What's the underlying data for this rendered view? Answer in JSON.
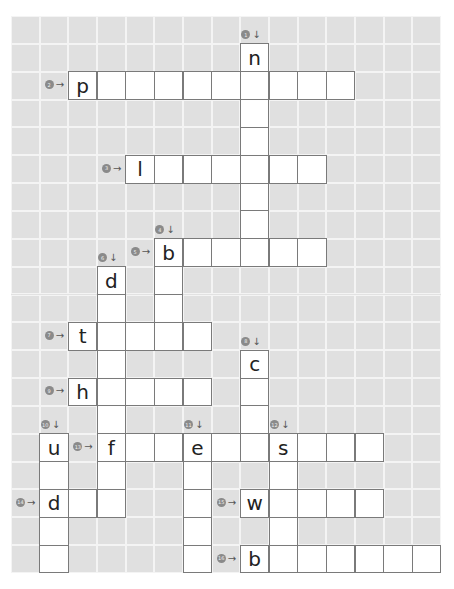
{
  "puzzle": {
    "type": "crossword",
    "grid": {
      "cols": 15,
      "rows": 20
    },
    "colors": {
      "background": "#ffffff",
      "grid_cell": "#e0e0e0",
      "grid_line": "#f4f4f4",
      "answer_cell": "#ffffff",
      "answer_border": "#7a7a7a",
      "marker": "#8a8a8a"
    },
    "entries": [
      {
        "number": "1",
        "direction": "down",
        "arrow": "↓",
        "row": 1,
        "col": 8,
        "length": 8,
        "first_letter": "n"
      },
      {
        "number": "2",
        "direction": "across",
        "arrow": "→",
        "row": 2,
        "col": 2,
        "length": 10,
        "first_letter": "p"
      },
      {
        "number": "3",
        "direction": "across",
        "arrow": "→",
        "row": 5,
        "col": 4,
        "length": 7,
        "first_letter": "l"
      },
      {
        "number": "4",
        "direction": "down",
        "arrow": "↓",
        "row": 8,
        "col": 5,
        "length": 4,
        "first_letter": "b"
      },
      {
        "number": "5",
        "direction": "across",
        "arrow": "→",
        "row": 8,
        "col": 5,
        "length": 6,
        "first_letter": "b"
      },
      {
        "number": "6",
        "direction": "down",
        "arrow": "↓",
        "row": 9,
        "col": 3,
        "length": 9,
        "first_letter": "d"
      },
      {
        "number": "7",
        "direction": "across",
        "arrow": "→",
        "row": 11,
        "col": 2,
        "length": 5,
        "first_letter": "t"
      },
      {
        "number": "8",
        "direction": "down",
        "arrow": "↓",
        "row": 12,
        "col": 8,
        "length": 4,
        "first_letter": "c"
      },
      {
        "number": "9",
        "direction": "across",
        "arrow": "→",
        "row": 13,
        "col": 2,
        "length": 5,
        "first_letter": "h"
      },
      {
        "number": "10",
        "direction": "down",
        "arrow": "↓",
        "row": 15,
        "col": 1,
        "length": 5,
        "first_letter": "u"
      },
      {
        "number": "11",
        "direction": "down",
        "arrow": "↓",
        "row": 15,
        "col": 6,
        "length": 5,
        "first_letter": "e"
      },
      {
        "number": "12",
        "direction": "down",
        "arrow": "↓",
        "row": 15,
        "col": 9,
        "length": 5,
        "first_letter": "s"
      },
      {
        "number": "13",
        "direction": "across",
        "arrow": "→",
        "row": 15,
        "col": 3,
        "length": 10,
        "first_letter": "f"
      },
      {
        "number": "14",
        "direction": "across",
        "arrow": "→",
        "row": 17,
        "col": 1,
        "length": 3,
        "first_letter": "d"
      },
      {
        "number": "15",
        "direction": "across",
        "arrow": "→",
        "row": 17,
        "col": 8,
        "length": 5,
        "first_letter": "w"
      },
      {
        "number": "16",
        "direction": "across",
        "arrow": "→",
        "row": 19,
        "col": 8,
        "length": 7,
        "first_letter": "b"
      }
    ]
  }
}
